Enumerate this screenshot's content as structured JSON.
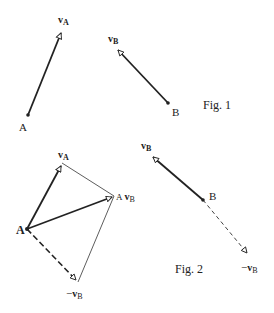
{
  "colors": {
    "ink": "#222222",
    "background": "#ffffff"
  },
  "fig1": {
    "caption": "Fig. 1",
    "point_A": {
      "label": "A",
      "x": 28,
      "y": 115
    },
    "point_B": {
      "label": "B",
      "x": 168,
      "y": 103
    },
    "vector_vA": {
      "symbol": "v",
      "subscript": "A",
      "from": [
        28,
        115
      ],
      "to": [
        62,
        30
      ]
    },
    "vector_vB": {
      "symbol": "v",
      "subscript": "B",
      "from": [
        168,
        103
      ],
      "to": [
        116,
        48
      ]
    }
  },
  "fig2": {
    "caption": "Fig. 2",
    "point_A": {
      "label": "A",
      "x": 27,
      "y": 229
    },
    "point_B": {
      "label": "B",
      "x": 203,
      "y": 200
    },
    "vector_vA": {
      "symbol": "v",
      "subscript": "A",
      "from": [
        27,
        229
      ],
      "to": [
        62,
        163
      ]
    },
    "vector_AvB": {
      "prefix": "A",
      "symbol": "v",
      "subscript": "B",
      "from": [
        27,
        229
      ],
      "to": [
        114,
        196
      ]
    },
    "vector_neg_vB_at_A": {
      "prefix": "−",
      "symbol": "v",
      "subscript": "B",
      "from": [
        27,
        229
      ],
      "to": [
        78,
        282
      ],
      "style": "dashed"
    },
    "vector_vB": {
      "symbol": "v",
      "subscript": "B",
      "from": [
        203,
        200
      ],
      "to": [
        151,
        155
      ]
    },
    "vector_neg_vB_at_B": {
      "prefix": "−",
      "symbol": "v",
      "subscript": "B",
      "from": [
        203,
        200
      ],
      "to": [
        249,
        255
      ],
      "style": "dashed"
    },
    "parallelogram_edges": [
      {
        "from": [
          62,
          163
        ],
        "to": [
          114,
          196
        ]
      },
      {
        "from": [
          114,
          196
        ],
        "to": [
          78,
          282
        ]
      }
    ]
  }
}
